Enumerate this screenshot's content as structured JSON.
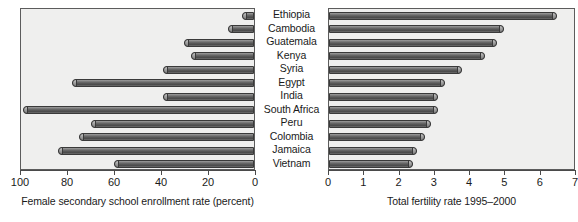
{
  "chart_data": [
    {
      "id": "left",
      "type": "bar",
      "orientation": "horizontal",
      "title": "",
      "xlabel": "Female secondary school enrollment rate (percent)",
      "ylabel": "",
      "xlim": [
        100,
        0
      ],
      "reversed": true,
      "grid": false,
      "legend": "none",
      "xticks": [
        100,
        80,
        60,
        40,
        20,
        0
      ],
      "xticklabels": [
        "100",
        "80",
        "60",
        "40",
        "20",
        "0"
      ],
      "categories": [
        "Ethiopia",
        "Cambodia",
        "Guatemala",
        "Kenya",
        "Syria",
        "Egypt",
        "India",
        "South Africa",
        "Peru",
        "Colombia",
        "Jamaica",
        "Vietnam"
      ],
      "values": [
        5,
        11,
        30,
        27,
        39,
        78,
        39,
        99,
        70,
        75,
        84,
        60
      ]
    },
    {
      "id": "right",
      "type": "bar",
      "orientation": "horizontal",
      "title": "",
      "xlabel": "Total fertility rate 1995–2000",
      "ylabel": "",
      "xlim": [
        0,
        7
      ],
      "reversed": false,
      "grid": false,
      "legend": "none",
      "xticks": [
        0,
        1,
        2,
        3,
        4,
        5,
        6,
        7
      ],
      "xticklabels": [
        "0",
        "1",
        "2",
        "3",
        "4",
        "5",
        "6",
        "7"
      ],
      "categories": [
        "Ethiopia",
        "Cambodia",
        "Guatemala",
        "Kenya",
        "Syria",
        "Egypt",
        "India",
        "South Africa",
        "Peru",
        "Colombia",
        "Jamaica",
        "Vietnam"
      ],
      "values": [
        6.5,
        5.0,
        4.8,
        4.45,
        3.8,
        3.3,
        3.1,
        3.1,
        2.9,
        2.75,
        2.5,
        2.4
      ]
    }
  ],
  "countries": [
    "Ethiopia",
    "Cambodia",
    "Guatemala",
    "Kenya",
    "Syria",
    "Egypt",
    "India",
    "South Africa",
    "Peru",
    "Colombia",
    "Jamaica",
    "Vietnam"
  ],
  "colors": {
    "bar_fill_dark": "#4b4b4b",
    "bar_fill_light": "#9d9d9d",
    "bar_edge": "#3a3a3a",
    "panel_background": "#efefee",
    "panel_border": "#5c5c5c",
    "text": "#1a1a1a",
    "page_background": "#ffffff"
  }
}
